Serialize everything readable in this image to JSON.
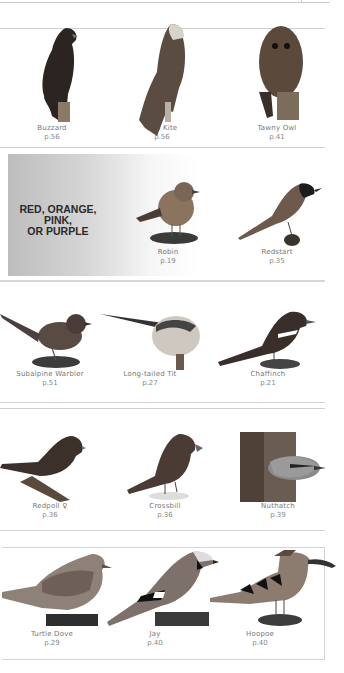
{
  "section_label": {
    "lines": [
      "RED, ORANGE,",
      "PINK,",
      "OR PURPLE"
    ]
  },
  "rows": [
    {
      "birds": [
        {
          "name": "Buzzard",
          "page": "p.56"
        },
        {
          "name": "Red Kite",
          "page": "p.56"
        },
        {
          "name": "Tawny Owl",
          "page": "p.41"
        }
      ]
    },
    {
      "birds": [
        {
          "name": "Robin",
          "page": "p.19"
        },
        {
          "name": "Redstart",
          "page": "p.35"
        }
      ]
    },
    {
      "birds": [
        {
          "name": "Subalpine Warbler",
          "page": "p.51"
        },
        {
          "name": "Long-tailed Tit",
          "page": "p.27"
        },
        {
          "name": "Chaffinch",
          "page": "p.21"
        }
      ]
    },
    {
      "birds": [
        {
          "name": "Redpoll ♀",
          "page": "p.36"
        },
        {
          "name": "Crossbill",
          "page": "p.36"
        },
        {
          "name": "Nuthatch",
          "page": "p.39"
        }
      ]
    },
    {
      "birds": [
        {
          "name": "Turtle Dove",
          "page": "p.29"
        },
        {
          "name": "Jay",
          "page": "p.40"
        },
        {
          "name": "Hoopoe",
          "page": "p.40"
        }
      ]
    }
  ]
}
